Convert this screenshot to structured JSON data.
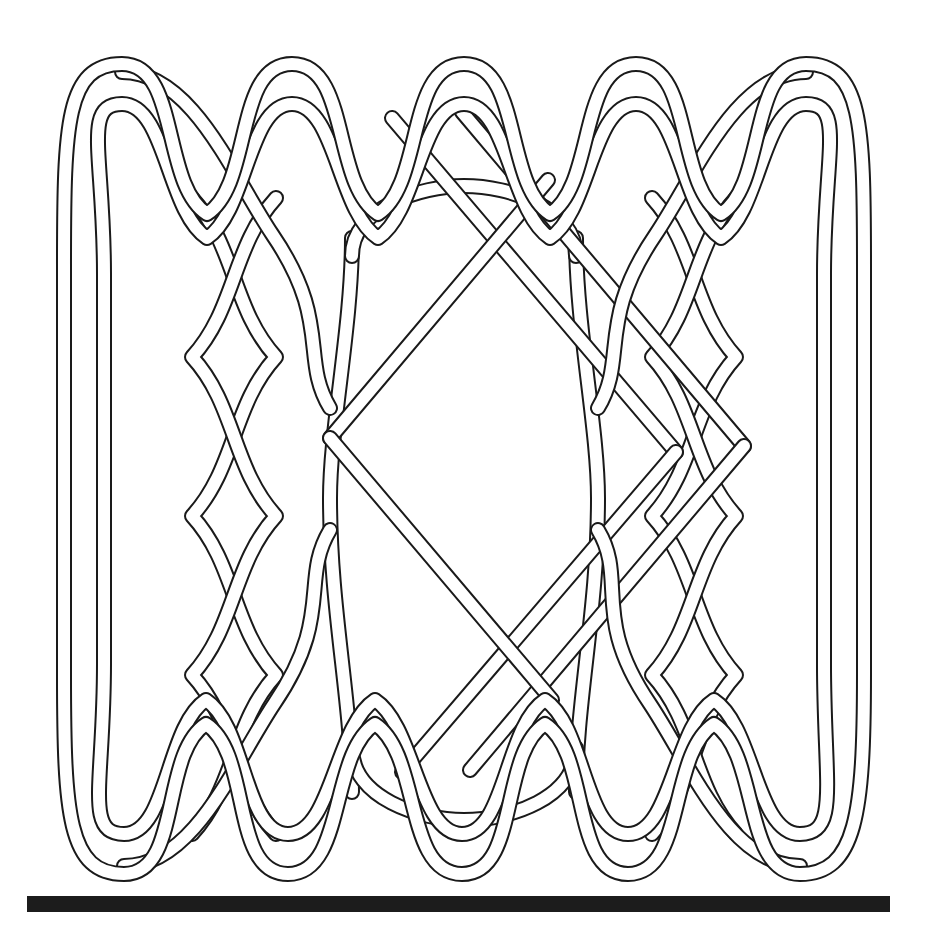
{
  "figure": {
    "kind": "line-drawing",
    "background_color": "#ffffff",
    "stroke_color": "#1a1a1a",
    "band_fill_color": "#ffffff",
    "band_outer_width_px": 16,
    "band_edge_width_px": 2,
    "canvas": {
      "width": 928,
      "height": 949
    }
  },
  "knot": {
    "bounds": {
      "left": 62,
      "top": 62,
      "right": 866,
      "bottom": 876
    },
    "grid": {
      "columns": 5,
      "rows": 5,
      "cell_width": 174,
      "cell_height": 163
    },
    "top_loops": 5,
    "bottom_loops": 5,
    "top_loop_centers_x": [
      122,
      292,
      464,
      636,
      806
    ],
    "bottom_loop_centers_x": [
      124,
      288,
      462,
      628,
      800
    ],
    "left_edge_x": 64,
    "right_edge_x": 864,
    "top_edge_y": 64,
    "bottom_edge_y": 874
  },
  "baseline": {
    "name": "baseline-bar",
    "color": "#1c1c1c",
    "left": 27,
    "top": 896,
    "width": 863,
    "height": 16
  }
}
